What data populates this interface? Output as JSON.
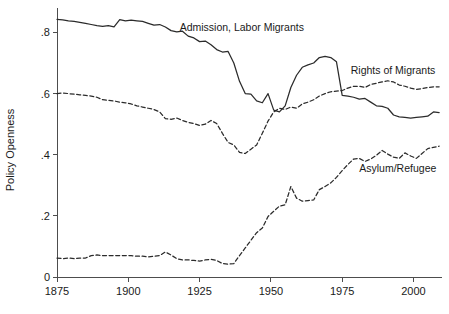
{
  "chart_data": {
    "type": "line",
    "title": "",
    "xlabel": "",
    "ylabel": "Policy Openness",
    "xlim": [
      1875,
      2010
    ],
    "ylim": [
      0,
      0.88
    ],
    "grid": false,
    "legend_position": "inline-annotations",
    "xticks": [
      1875,
      1900,
      1925,
      1950,
      1975,
      2000
    ],
    "xtick_labels": [
      "1875",
      "1900",
      "1925",
      "1950",
      "1975",
      "2000"
    ],
    "yticks": [
      0,
      0.2,
      0.4,
      0.6,
      0.8
    ],
    "ytick_labels": [
      "0",
      ".2",
      ".4",
      ".6",
      ".8"
    ],
    "series": [
      {
        "name": "Admission, Labor Migrants",
        "style": "solid",
        "label_x": 1918,
        "label_y": 0.805,
        "x": [
          1875,
          1877,
          1879,
          1881,
          1883,
          1885,
          1887,
          1889,
          1891,
          1893,
          1895,
          1897,
          1899,
          1901,
          1903,
          1905,
          1907,
          1909,
          1911,
          1913,
          1915,
          1917,
          1919,
          1921,
          1923,
          1925,
          1927,
          1929,
          1931,
          1933,
          1935,
          1937,
          1939,
          1941,
          1943,
          1945,
          1947,
          1949,
          1951,
          1953,
          1955,
          1957,
          1959,
          1961,
          1963,
          1965,
          1967,
          1969,
          1971,
          1973,
          1975,
          1977,
          1979,
          1981,
          1983,
          1985,
          1987,
          1989,
          1991,
          1993,
          1995,
          1997,
          1999,
          2001,
          2003,
          2005,
          2007,
          2009
        ],
        "y": [
          0.843,
          0.841,
          0.838,
          0.836,
          0.833,
          0.83,
          0.826,
          0.822,
          0.82,
          0.822,
          0.818,
          0.842,
          0.838,
          0.84,
          0.838,
          0.836,
          0.83,
          0.824,
          0.826,
          0.818,
          0.806,
          0.802,
          0.804,
          0.788,
          0.782,
          0.77,
          0.772,
          0.76,
          0.744,
          0.736,
          0.738,
          0.7,
          0.64,
          0.6,
          0.598,
          0.576,
          0.57,
          0.6,
          0.546,
          0.54,
          0.56,
          0.62,
          0.66,
          0.686,
          0.694,
          0.7,
          0.718,
          0.722,
          0.718,
          0.704,
          0.594,
          0.592,
          0.588,
          0.582,
          0.584,
          0.572,
          0.56,
          0.558,
          0.552,
          0.53,
          0.524,
          0.522,
          0.52,
          0.522,
          0.524,
          0.526,
          0.54,
          0.538
        ]
      },
      {
        "name": "Rights of Migrants",
        "style": "dashed",
        "label_x": 1978,
        "label_y": 0.665,
        "x": [
          1875,
          1877,
          1879,
          1881,
          1883,
          1885,
          1887,
          1889,
          1891,
          1893,
          1895,
          1897,
          1899,
          1901,
          1903,
          1905,
          1907,
          1909,
          1911,
          1913,
          1915,
          1917,
          1919,
          1921,
          1923,
          1925,
          1927,
          1929,
          1931,
          1933,
          1935,
          1937,
          1939,
          1941,
          1943,
          1945,
          1947,
          1949,
          1951,
          1953,
          1955,
          1957,
          1959,
          1961,
          1963,
          1965,
          1967,
          1969,
          1971,
          1973,
          1975,
          1977,
          1979,
          1981,
          1983,
          1985,
          1987,
          1989,
          1991,
          1993,
          1995,
          1997,
          1999,
          2001,
          2003,
          2005,
          2007,
          2009
        ],
        "y": [
          0.6,
          0.602,
          0.6,
          0.598,
          0.596,
          0.594,
          0.592,
          0.588,
          0.58,
          0.578,
          0.576,
          0.572,
          0.57,
          0.566,
          0.56,
          0.556,
          0.552,
          0.548,
          0.54,
          0.518,
          0.516,
          0.52,
          0.512,
          0.506,
          0.502,
          0.496,
          0.5,
          0.512,
          0.502,
          0.47,
          0.44,
          0.432,
          0.408,
          0.404,
          0.418,
          0.432,
          0.47,
          0.51,
          0.54,
          0.552,
          0.548,
          0.556,
          0.552,
          0.566,
          0.572,
          0.58,
          0.592,
          0.6,
          0.606,
          0.608,
          0.61,
          0.618,
          0.624,
          0.624,
          0.62,
          0.63,
          0.634,
          0.638,
          0.642,
          0.638,
          0.628,
          0.624,
          0.618,
          0.614,
          0.616,
          0.62,
          0.622,
          0.622
        ]
      },
      {
        "name": "Asylum/Refugee",
        "style": "dashed",
        "label_x": 1981,
        "label_y": 0.345,
        "x": [
          1875,
          1877,
          1879,
          1881,
          1883,
          1885,
          1887,
          1889,
          1891,
          1893,
          1895,
          1897,
          1899,
          1901,
          1903,
          1905,
          1907,
          1909,
          1911,
          1913,
          1915,
          1917,
          1919,
          1921,
          1923,
          1925,
          1927,
          1929,
          1931,
          1933,
          1935,
          1937,
          1939,
          1941,
          1943,
          1945,
          1947,
          1949,
          1951,
          1953,
          1955,
          1957,
          1959,
          1961,
          1963,
          1965,
          1967,
          1969,
          1971,
          1973,
          1975,
          1977,
          1979,
          1981,
          1983,
          1985,
          1987,
          1989,
          1991,
          1993,
          1995,
          1997,
          1999,
          2001,
          2003,
          2005,
          2007,
          2009
        ],
        "y": [
          0.062,
          0.06,
          0.062,
          0.06,
          0.062,
          0.062,
          0.07,
          0.072,
          0.07,
          0.07,
          0.07,
          0.07,
          0.07,
          0.07,
          0.068,
          0.068,
          0.066,
          0.068,
          0.07,
          0.082,
          0.072,
          0.06,
          0.056,
          0.056,
          0.054,
          0.052,
          0.056,
          0.058,
          0.054,
          0.044,
          0.042,
          0.044,
          0.07,
          0.095,
          0.12,
          0.145,
          0.16,
          0.198,
          0.215,
          0.232,
          0.236,
          0.296,
          0.258,
          0.248,
          0.25,
          0.252,
          0.286,
          0.296,
          0.308,
          0.326,
          0.348,
          0.368,
          0.386,
          0.388,
          0.378,
          0.386,
          0.398,
          0.414,
          0.402,
          0.392,
          0.388,
          0.406,
          0.396,
          0.388,
          0.404,
          0.42,
          0.424,
          0.428
        ]
      }
    ]
  }
}
